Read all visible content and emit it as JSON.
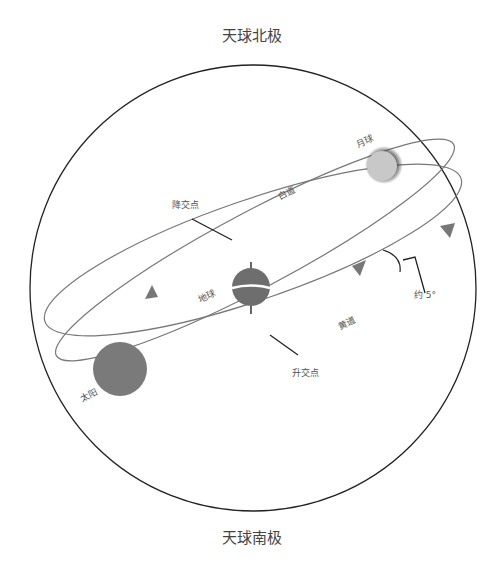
{
  "diagram": {
    "title_top": "天球北极",
    "title_bottom": "天球南极",
    "labels": {
      "moon": "月球",
      "earth": "地球",
      "sun": "太阳",
      "lunar_orbit": "白道",
      "ecliptic": "黄道",
      "descending_node": "降交点",
      "ascending_node": "升交点",
      "inclination": "约 5°"
    },
    "colors": {
      "sphere_outline": "#222222",
      "orbit_line": "#777777",
      "body_fill": "#7a7a7a",
      "moon_fill": "#c8c8c8",
      "arrow_fill": "#777777",
      "pointer_line": "#222222"
    }
  }
}
